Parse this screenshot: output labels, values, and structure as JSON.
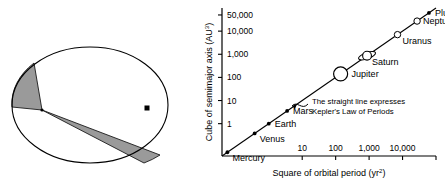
{
  "figure": {
    "panels": [
      {
        "name": "equal-areas-ellipse",
        "caption": ""
      },
      {
        "name": "law-of-periods-plot",
        "caption": ""
      }
    ]
  },
  "ellipse_panel": {
    "name": "equal-area-sweep-diagram",
    "orbit_shape": "ellipse",
    "focus_marker": "filled-dot",
    "sweep_sectors": 2,
    "sector_fill": "#9a9a9a",
    "orbit_stroke": "#000000",
    "labels": []
  },
  "chart_data": {
    "type": "scatter",
    "title": "",
    "xlabel": "Square of orbital period (yr²)",
    "ylabel": "Cube of semimajor axis (AU³)",
    "xlabel_base": "Square of orbital period (yr",
    "xlabel_sup": "2",
    "xlabel_tail": ")",
    "ylabel_base": "Cube of semimajor axis (AU",
    "ylabel_sup": "3",
    "ylabel_tail": ")",
    "xscale": "log",
    "yscale": "log",
    "xlim": [
      0.04,
      100000
    ],
    "ylim": [
      0.04,
      100000
    ],
    "grid": false,
    "legend": false,
    "xticks": [
      {
        "value": 10,
        "label": "10"
      },
      {
        "value": 100,
        "label": "100"
      },
      {
        "value": 1000,
        "label": "1,000"
      },
      {
        "value": 10000,
        "label": "10,000"
      },
      {
        "value": 100000,
        "label": ""
      }
    ],
    "yticks": [
      {
        "value": 1,
        "label": "1"
      },
      {
        "value": 10,
        "label": "10"
      },
      {
        "value": 100,
        "label": "100"
      },
      {
        "value": 1000,
        "label": "1,000"
      },
      {
        "value": 10000,
        "label": "10,000"
      },
      {
        "value": 50000,
        "label": "50,000"
      }
    ],
    "points": [
      {
        "name": "Mercury",
        "label": "Mercury",
        "x": 0.058,
        "y": 0.058,
        "marker": "dot",
        "label_pos": "below-right"
      },
      {
        "name": "Venus",
        "label": "Venus",
        "x": 0.378,
        "y": 0.378,
        "marker": "dot",
        "label_pos": "below-right"
      },
      {
        "name": "Earth",
        "label": "Earth",
        "x": 1.0,
        "y": 1.0,
        "marker": "dot",
        "label_pos": "right"
      },
      {
        "name": "Mars",
        "label": "Mars",
        "x": 3.54,
        "y": 3.54,
        "marker": "dot",
        "label_pos": "right"
      },
      {
        "name": "Jupiter",
        "label": "Jupiter",
        "x": 140.7,
        "y": 140.7,
        "marker": "big-circle",
        "label_pos": "right"
      },
      {
        "name": "Saturn",
        "label": "Saturn",
        "x": 867,
        "y": 867,
        "marker": "ringed-circle",
        "label_pos": "below-right"
      },
      {
        "name": "Uranus",
        "label": "Uranus",
        "x": 7060,
        "y": 7060,
        "marker": "open-circle",
        "label_pos": "below-right"
      },
      {
        "name": "Neptune",
        "label": "Neptune",
        "x": 27200,
        "y": 27200,
        "marker": "open-circle",
        "label_pos": "right"
      },
      {
        "name": "Pluto",
        "label": "Pluto",
        "x": 61500,
        "y": 61500,
        "marker": "dot",
        "label_pos": "right"
      }
    ],
    "trendline": {
      "name": "kepler-law-line",
      "from": [
        0.04,
        0.04
      ],
      "to": [
        100000,
        100000
      ],
      "style": "solid"
    },
    "annotation": {
      "line1": "The straight line expresses",
      "line2": "Kepler's Law of Periods",
      "arrow": "curved-arrow-to-line"
    },
    "colors": {
      "axis": "#000000",
      "line": "#000000",
      "marker_fill": "#ffffff",
      "marker_stroke": "#000000",
      "text": "#000000"
    }
  }
}
